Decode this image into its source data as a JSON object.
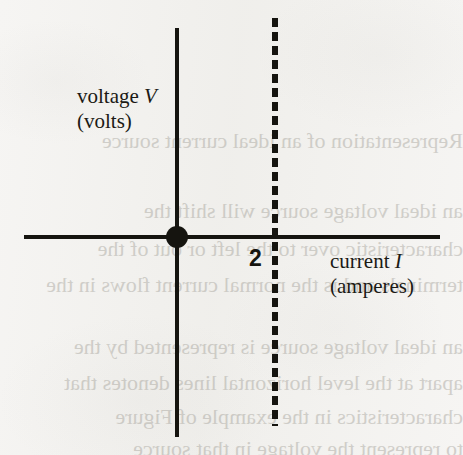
{
  "figure": {
    "type": "iv-characteristic-diagram",
    "background_color": "#f6f5f3",
    "ink_color": "#15140f"
  },
  "axes": {
    "vertical": {
      "name": "voltage-axis",
      "quantity": "voltage",
      "symbol": "V",
      "unit_label": "(volts)",
      "label_line1_prefix": "voltage ",
      "label_line1_symbol": "V",
      "label_line2": "(volts)"
    },
    "horizontal": {
      "name": "current-axis",
      "quantity": "current",
      "symbol": "I",
      "unit_label": "(amperes)",
      "label_line1_prefix": "current ",
      "label_line1_symbol": "I",
      "label_line2": "(amperes)"
    }
  },
  "markers": {
    "origin_dot": {
      "name": "origin-point",
      "current": 0,
      "voltage": 0
    },
    "tick": {
      "name": "current-tick-2",
      "value": "2",
      "unit": "amperes"
    }
  },
  "bleed_through": [
    {
      "text": "Representation of an ideal current source",
      "x": 0,
      "y": 128,
      "size": 22
    },
    {
      "text": "an ideal voltage source will shift the",
      "x": 0,
      "y": 198,
      "size": 22
    },
    {
      "text": "characteristic over to the left or out of the",
      "x": 0,
      "y": 236,
      "size": 22
    },
    {
      "text": "terminals and is the normal current flows in the",
      "x": 0,
      "y": 272,
      "size": 22
    },
    {
      "text": "an ideal voltage source is represented by the",
      "x": 0,
      "y": 334,
      "size": 22
    },
    {
      "text": "apart at the level horizontal lines denotes that",
      "x": 0,
      "y": 370,
      "size": 22
    },
    {
      "text": "characteristics in the example of Figure",
      "x": 0,
      "y": 404,
      "size": 22
    },
    {
      "text": "to represent the voltage in that source",
      "x": 0,
      "y": 436,
      "size": 22
    }
  ],
  "chart_data": {
    "type": "line",
    "title": "",
    "xlabel": "current I (amperes)",
    "ylabel": "voltage V (volts)",
    "xlim": [
      -3.7,
      5.9
    ],
    "ylim": [
      -4.5,
      4.3
    ],
    "grid": false,
    "legend": "none",
    "series": [
      {
        "name": "ideal current source characteristic",
        "style": "dashed",
        "orientation": "vertical",
        "x": [
          2,
          2
        ],
        "y": [
          4.3,
          -4.5
        ]
      }
    ],
    "annotations": [
      {
        "name": "origin-dot",
        "type": "point",
        "x": 0,
        "y": 0,
        "marker": "filled-circle"
      },
      {
        "name": "tick-label-2",
        "type": "text",
        "text": "2",
        "x": 1.72,
        "y": -0.45
      }
    ]
  }
}
